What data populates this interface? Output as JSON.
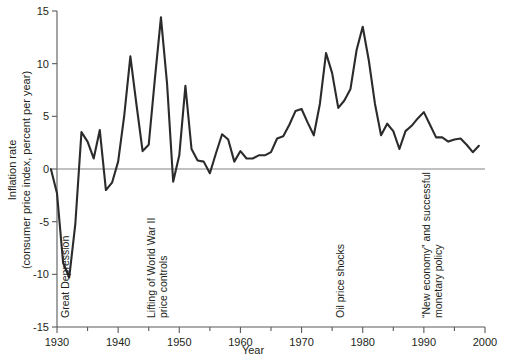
{
  "chart_data": {
    "type": "line",
    "title": "",
    "xlabel": "Year",
    "ylabel": "Inflation rate (consumer price index, percent per year)",
    "ylabel_line1": "Inflation rate",
    "ylabel_line2": "(consumer price index, percent per year)",
    "xlim": [
      1929,
      2000
    ],
    "ylim": [
      -15,
      15
    ],
    "grid": false,
    "legend": "none",
    "zero_line": true,
    "x_major_ticks": [
      1930,
      1940,
      1950,
      1960,
      1970,
      1980,
      1990,
      2000
    ],
    "x_minor_ticks": [
      1935,
      1945,
      1955,
      1965,
      1975,
      1985,
      1995
    ],
    "x_tick_labels": [
      "1930",
      "1940",
      "1950",
      "1960",
      "1970",
      "1980",
      "1990",
      "2000"
    ],
    "y_ticks": [
      -15,
      -10,
      -5,
      0,
      5,
      10,
      15
    ],
    "y_tick_labels": [
      "-15",
      "-10",
      "-5",
      "0",
      "5",
      "10",
      "15"
    ],
    "series": [
      {
        "name": "CPI inflation rate",
        "color": "#2b2b2b",
        "x": [
          1929,
          1930,
          1931,
          1932,
          1933,
          1934,
          1935,
          1936,
          1937,
          1938,
          1939,
          1940,
          1941,
          1942,
          1943,
          1944,
          1945,
          1946,
          1947,
          1948,
          1949,
          1950,
          1951,
          1952,
          1953,
          1954,
          1955,
          1956,
          1957,
          1958,
          1959,
          1960,
          1961,
          1962,
          1963,
          1964,
          1965,
          1966,
          1967,
          1968,
          1969,
          1970,
          1971,
          1972,
          1973,
          1974,
          1975,
          1976,
          1977,
          1978,
          1979,
          1980,
          1981,
          1982,
          1983,
          1984,
          1985,
          1986,
          1987,
          1988,
          1989,
          1990,
          1991,
          1992,
          1993,
          1994,
          1995,
          1996,
          1997,
          1998,
          1999
        ],
        "values": [
          0.0,
          -2.3,
          -8.9,
          -10.3,
          -5.2,
          3.5,
          2.6,
          1.0,
          3.7,
          -2.0,
          -1.3,
          0.7,
          5.1,
          10.7,
          6.1,
          1.7,
          2.3,
          8.5,
          14.4,
          8.1,
          -1.2,
          1.3,
          7.9,
          1.9,
          0.8,
          0.7,
          -0.4,
          1.5,
          3.3,
          2.8,
          0.7,
          1.7,
          1.0,
          1.0,
          1.3,
          1.3,
          1.6,
          2.9,
          3.1,
          4.2,
          5.5,
          5.7,
          4.4,
          3.2,
          6.2,
          11.0,
          9.1,
          5.8,
          6.5,
          7.6,
          11.3,
          13.5,
          10.3,
          6.2,
          3.2,
          4.3,
          3.6,
          1.9,
          3.6,
          4.1,
          4.8,
          5.4,
          4.2,
          3.0,
          3.0,
          2.6,
          2.8,
          2.9,
          2.3,
          1.6,
          2.2
        ]
      }
    ],
    "annotations": [
      {
        "id": "great-depression",
        "text": "Great Depression",
        "lines": [
          "Great Depression"
        ],
        "x_year": 1932,
        "orientation": "vertical"
      },
      {
        "id": "wwii-price-controls",
        "text": "Lifting of World War II price controls",
        "lines": [
          "Lifting of World War II",
          "price controls"
        ],
        "x_year": 1946,
        "orientation": "vertical"
      },
      {
        "id": "oil-price-shocks",
        "text": "Oil price shocks",
        "lines": [
          "Oil price shocks"
        ],
        "x_year": 1977,
        "orientation": "vertical"
      },
      {
        "id": "new-economy",
        "text": "“New economy” and successful monetary policy",
        "lines": [
          "“New economy” and successful",
          "monetary policy"
        ],
        "x_year": 1991,
        "orientation": "vertical"
      }
    ]
  },
  "colors": {
    "line": "#2b2b2b",
    "axis": "#58595b",
    "zero_axis": "#808285",
    "text": "#231f20",
    "background": "#ffffff"
  }
}
